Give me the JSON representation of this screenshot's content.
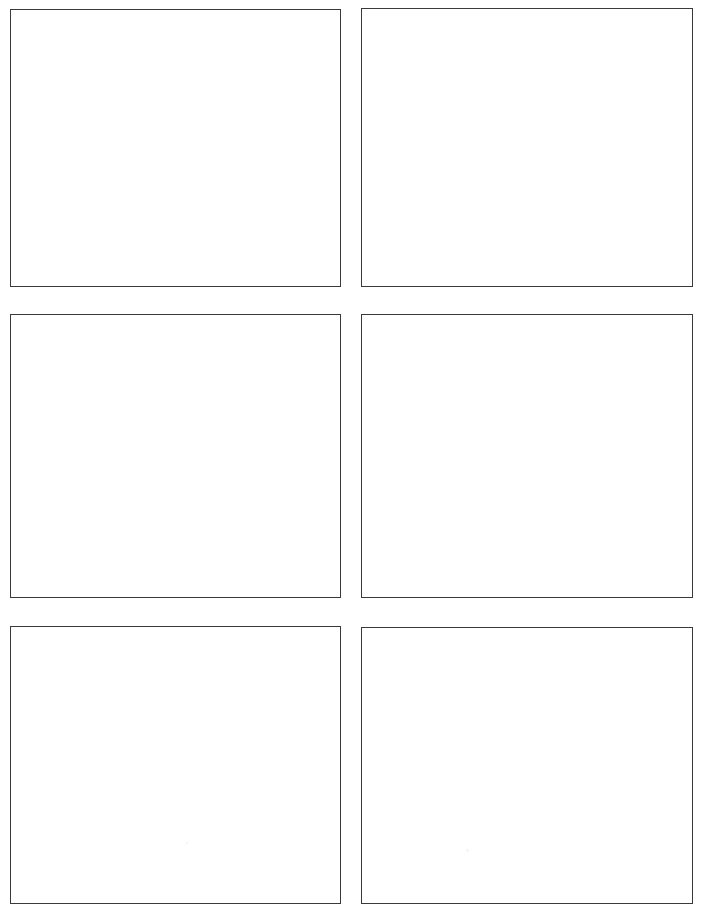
{
  "document": {
    "kind": "blank-grid-worksheet",
    "page_width": 702,
    "page_height": 911,
    "background_color": "#ffffff",
    "border_color": "#3a3a3c",
    "border_width_px": 1,
    "columns": 2,
    "rows": 3,
    "panel_count": 6
  },
  "panels": [
    {
      "id": "panel-1",
      "row": 1,
      "column": 1,
      "label": "",
      "content": ""
    },
    {
      "id": "panel-2",
      "row": 1,
      "column": 2,
      "label": "",
      "content": ""
    },
    {
      "id": "panel-3",
      "row": 2,
      "column": 1,
      "label": "",
      "content": ""
    },
    {
      "id": "panel-4",
      "row": 2,
      "column": 2,
      "label": "",
      "content": ""
    },
    {
      "id": "panel-5",
      "row": 3,
      "column": 1,
      "label": "",
      "content": ""
    },
    {
      "id": "panel-6",
      "row": 3,
      "column": 2,
      "label": "",
      "content": ""
    }
  ]
}
